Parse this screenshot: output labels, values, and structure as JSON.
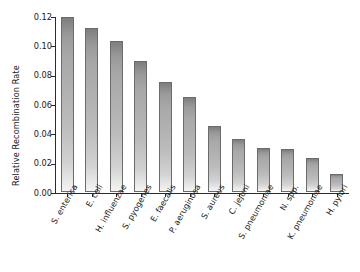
{
  "chart_data": {
    "type": "bar",
    "title": "",
    "xlabel": "",
    "ylabel": "Relative Recombination Rate",
    "categories": [
      "S. enterica",
      "E. coli",
      "H. influenzae",
      "S. pyogenes",
      "E. faecalis",
      "P. aeruginosa",
      "S. aureus",
      "C. jejuni",
      "S. pneumoniae",
      "N. spp.",
      "K. pneumoniae",
      "H. pylori"
    ],
    "values": [
      0.119,
      0.112,
      0.103,
      0.089,
      0.075,
      0.065,
      0.045,
      0.036,
      0.03,
      0.029,
      0.023,
      0.012
    ],
    "ylim": [
      0.0,
      0.12
    ],
    "ytick_labels": [
      "0.00",
      "0.02",
      "0.04",
      "0.06",
      "0.08",
      "0.10",
      "0.12"
    ],
    "ytick_values": [
      0.0,
      0.02,
      0.04,
      0.06,
      0.08,
      0.1,
      0.12
    ],
    "grid": false,
    "legend": null,
    "bar_color_top": "#7e7e7e",
    "bar_color_bottom": "#f4f4f4",
    "bar_edge_color": "#6b6b6b",
    "axis_color": "#2b2b2b",
    "background": "#ffffff"
  }
}
